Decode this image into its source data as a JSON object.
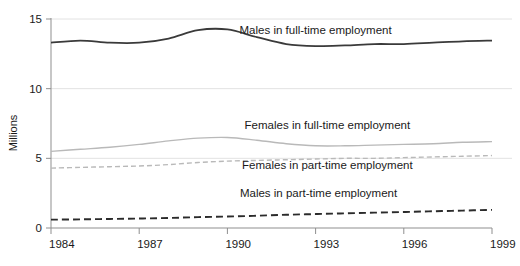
{
  "chart_data": {
    "type": "line",
    "title": "",
    "subtitle": "",
    "xlabel": "",
    "ylabel": "Millions",
    "xlim": [
      1984,
      1999
    ],
    "ylim": [
      0,
      15
    ],
    "grid": "horizontal",
    "legend_position": "inline-labels",
    "x": [
      1984,
      1985,
      1986,
      1987,
      1988,
      1989,
      1990,
      1991,
      1992,
      1993,
      1994,
      1995,
      1996,
      1997,
      1998,
      1999
    ],
    "xticks": [
      "1984",
      "1987",
      "1990",
      "1993",
      "1996",
      "1999"
    ],
    "xtick_values": [
      1984,
      1987,
      1990,
      1993,
      1996,
      1999
    ],
    "yticks": [
      "0",
      "5",
      "10",
      "15"
    ],
    "ytick_values": [
      0,
      5,
      10,
      15
    ],
    "series": [
      {
        "name": "Males in full-time employment",
        "style": "solid",
        "color": "#3a3a3a",
        "width": 1.8,
        "label_x": 1993.0,
        "label_y": 13.95,
        "values": [
          13.3,
          13.45,
          13.3,
          13.3,
          13.6,
          14.2,
          14.25,
          13.7,
          13.2,
          13.05,
          13.1,
          13.2,
          13.2,
          13.3,
          13.4,
          13.45
        ]
      },
      {
        "name": "Females in full-time employment",
        "style": "solid",
        "color": "#b9b9b9",
        "width": 1.4,
        "label_x": 1993.4,
        "label_y": 7.1,
        "values": [
          5.5,
          5.65,
          5.8,
          6.0,
          6.25,
          6.45,
          6.5,
          6.3,
          6.05,
          5.9,
          5.9,
          5.95,
          6.0,
          6.05,
          6.15,
          6.2
        ]
      },
      {
        "name": "Females in part-time employment",
        "style": "dashed",
        "color": "#b9b9b9",
        "width": 1.4,
        "label_x": 1993.4,
        "label_y": 4.25,
        "values": [
          4.3,
          4.35,
          4.4,
          4.45,
          4.55,
          4.7,
          4.8,
          4.85,
          4.9,
          4.95,
          5.0,
          5.0,
          5.05,
          5.1,
          5.15,
          5.2
        ]
      },
      {
        "name": "Males in part-time employment",
        "style": "dashed",
        "color": "#2b2b2b",
        "width": 1.9,
        "label_x": 1993.1,
        "label_y": 2.2,
        "values": [
          0.6,
          0.62,
          0.65,
          0.68,
          0.72,
          0.78,
          0.82,
          0.88,
          0.95,
          1.0,
          1.05,
          1.1,
          1.15,
          1.2,
          1.25,
          1.3
        ]
      }
    ]
  },
  "axes": {
    "y_axis_label": "Millions"
  }
}
